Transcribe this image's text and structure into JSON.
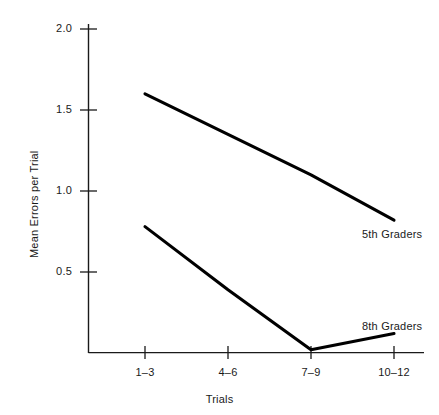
{
  "chart_data": {
    "type": "line",
    "title": "",
    "xlabel": "Trials",
    "ylabel": "Mean Errors per Trial",
    "categories": [
      "1–3",
      "4–6",
      "7–9",
      "10–12"
    ],
    "yticks": [
      "0.5",
      "1.0",
      "1.5",
      "2.0"
    ],
    "ytick_values": [
      0.5,
      1.0,
      1.5,
      2.0
    ],
    "ylim": [
      0,
      2.15
    ],
    "grid": false,
    "legend_position": "inline-right",
    "series": [
      {
        "name": "5th Graders",
        "values": [
          1.6,
          1.35,
          1.1,
          0.82
        ],
        "color": "#000000"
      },
      {
        "name": "8th Graders",
        "values": [
          0.78,
          0.39,
          0.02,
          0.12
        ],
        "color": "#000000"
      }
    ],
    "annotations": [
      {
        "text": "5th Graders",
        "series": "5th Graders"
      },
      {
        "text": "8th Graders",
        "series": "8th Graders"
      }
    ]
  },
  "axis": {
    "y_title": "Mean Errors per Trial",
    "x_title": "Trials",
    "y_tick_labels": [
      "2.0",
      "1.5",
      "1.0",
      "0.5"
    ],
    "x_tick_labels": [
      "1–3",
      "4–6",
      "7–9",
      "10–12"
    ]
  },
  "labels": {
    "series_5th": "5th Graders",
    "series_8th": "8th Graders"
  }
}
